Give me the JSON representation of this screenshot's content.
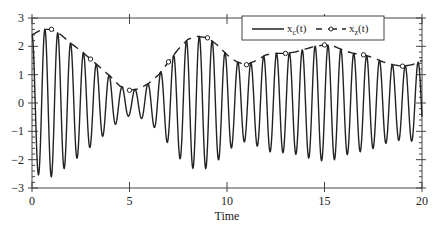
{
  "chart_data": {
    "type": "line",
    "title": "",
    "xlabel": "Time",
    "ylabel": "",
    "xlim": [
      0,
      20
    ],
    "ylim": [
      -3,
      3
    ],
    "xticks": [
      0,
      5,
      10,
      15,
      20
    ],
    "xtick_labels": [
      "0",
      "5",
      "10",
      "15",
      "20"
    ],
    "yticks": [
      -3,
      -2,
      -1,
      0,
      1,
      2,
      3
    ],
    "ytick_labels": [
      "-3",
      "-2",
      "-1",
      "0",
      "1",
      "2",
      "3"
    ],
    "grid": false,
    "legend_position": "upper right",
    "series": [
      {
        "name": "x_c(t)",
        "style": "solid",
        "description": "oscillating signal (~1.5 Hz) bounded by envelope x_z(t)",
        "carrier_period": 0.66
      },
      {
        "name": "x_z(t)",
        "style": "dashed with circle markers",
        "x": [
          0,
          0.5,
          1,
          1.5,
          2,
          2.5,
          3,
          3.5,
          4,
          4.5,
          5,
          5.5,
          6,
          6.5,
          7,
          7.5,
          8,
          8.5,
          9,
          9.5,
          10,
          10.5,
          11,
          11.5,
          12,
          12.5,
          13,
          13.5,
          14,
          14.5,
          15,
          15.5,
          16,
          16.5,
          17,
          17.5,
          18,
          18.5,
          19,
          19.5,
          20
        ],
        "values": [
          2.4,
          2.6,
          2.6,
          2.4,
          2.1,
          1.85,
          1.55,
          1.25,
          0.95,
          0.6,
          0.45,
          0.5,
          0.7,
          1.0,
          1.45,
          1.9,
          2.25,
          2.35,
          2.3,
          2.05,
          1.7,
          1.45,
          1.35,
          1.5,
          1.7,
          1.75,
          1.75,
          1.8,
          1.9,
          2.0,
          2.05,
          2.0,
          1.85,
          1.75,
          1.7,
          1.6,
          1.45,
          1.35,
          1.3,
          1.35,
          1.5
        ],
        "marker_x": [
          1,
          3,
          5,
          7,
          9,
          11,
          13,
          15,
          17,
          19
        ]
      }
    ],
    "legend": [
      "x_c(t)",
      "x_z(t)"
    ]
  },
  "axis": {
    "xlabel": "Time",
    "xticks": [
      "0",
      "5",
      "10",
      "15",
      "20"
    ],
    "yticks": [
      "3",
      "2",
      "1",
      "0",
      "−1",
      "−2",
      "−3"
    ]
  },
  "legend": {
    "items": [
      {
        "base": "x",
        "sub": "c",
        "suffix": "(t)"
      },
      {
        "base": "x",
        "sub": "z",
        "suffix": "(t)"
      }
    ]
  }
}
